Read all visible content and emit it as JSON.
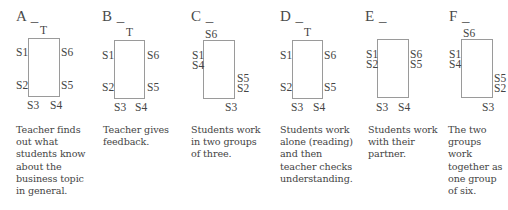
{
  "panels": [
    {
      "letter": "A _",
      "seats": {
        "T": "T",
        "S1": "S1",
        "S2": "S2",
        "S3": "S3",
        "S4": "S4",
        "S5": "S5",
        "S6": "S6"
      },
      "description": [
        "Teacher finds",
        "out what",
        "students know",
        "about the",
        "business topic",
        "in general."
      ]
    },
    {
      "letter": "B _",
      "seats": {
        "T": "T",
        "S1": "S1",
        "S2": "S2",
        "S3": "S3",
        "S4": "S4",
        "S5": "S5",
        "S6": "S6"
      },
      "description": [
        "Teacher gives",
        "feedback."
      ]
    },
    {
      "letter": "C _",
      "seats": {
        "S6": "S6",
        "S1": "S1",
        "S4": "S4",
        "S5": "S5",
        "S2": "S2",
        "S3": "S3"
      },
      "description": [
        "Students work",
        "in two groups",
        "of three."
      ]
    },
    {
      "letter": "D _",
      "seats": {
        "T": "T",
        "S1": "S1",
        "S2": "S2",
        "S3": "S3",
        "S4": "S4",
        "S5": "S5",
        "S6": "S6"
      },
      "description": [
        "Students work",
        "alone (reading)",
        "and then",
        "teacher checks",
        "understanding."
      ]
    },
    {
      "letter": "E _",
      "seats": {
        "S1": "S1",
        "S2": "S2",
        "S6": "S6",
        "S5": "S5",
        "S3": "S3",
        "S4": "S4"
      },
      "description": [
        "Students work",
        "with their",
        "partner."
      ]
    },
    {
      "letter": "F _",
      "seats": {
        "S6": "S6",
        "S1": "S1",
        "S4": "S4",
        "S5": "S5",
        "S2": "S2",
        "S3": "S3"
      },
      "description": [
        "The two",
        "groups",
        "work",
        "together as",
        "one group",
        "of six."
      ]
    }
  ]
}
